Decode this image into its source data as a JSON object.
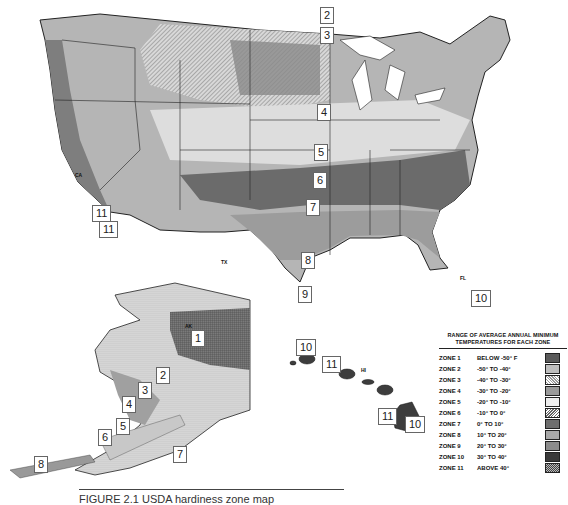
{
  "figure": {
    "caption": "FIGURE 2.1   USDA hardiness zone map",
    "caption_visible_fragment": "FIGURE 2.1  USDA hardi..."
  },
  "map": {
    "regions": [
      "Contiguous United States",
      "Alaska",
      "Hawaii"
    ],
    "zone_callouts": {
      "conus": [
        "2",
        "3",
        "4",
        "5",
        "6",
        "7",
        "8",
        "9",
        "10",
        "11",
        "11"
      ],
      "alaska": [
        "1",
        "2",
        "3",
        "4",
        "5",
        "6",
        "7",
        "8"
      ],
      "hawaii": [
        "10",
        "11",
        "11",
        "10"
      ]
    },
    "state_labels": [
      "WA",
      "OR",
      "CA",
      "NV",
      "ID",
      "MT",
      "WY",
      "UT",
      "AZ",
      "CO",
      "NM",
      "ND",
      "SD",
      "NE",
      "KS",
      "OK",
      "TX",
      "MN",
      "IA",
      "MO",
      "AR",
      "LA",
      "WI",
      "IL",
      "MI",
      "IN",
      "OH",
      "KY",
      "TN",
      "MS",
      "AL",
      "GA",
      "FL",
      "SC",
      "NC",
      "VA",
      "WV",
      "PA",
      "NY",
      "VT",
      "NH",
      "ME",
      "MA",
      "RI",
      "CT",
      "NJ",
      "DE",
      "MD",
      "AK",
      "HI"
    ]
  },
  "legend": {
    "title_line1": "RANGE OF AVERAGE ANNUAL MINIMUM",
    "title_line2": "TEMPERATURES FOR EACH ZONE",
    "rows": [
      {
        "zone": "ZONE 1",
        "range": "BELOW -50° F",
        "fill": "#5a5a5a",
        "pattern": "grid"
      },
      {
        "zone": "ZONE 2",
        "range": "-50°  TO -40°",
        "fill": "#bdbdbd",
        "pattern": "dots"
      },
      {
        "zone": "ZONE 3",
        "range": "-40°  TO -30°",
        "fill": "#e2e2e2",
        "pattern": "diag-light"
      },
      {
        "zone": "ZONE 4",
        "range": "-30°  TO -20°",
        "fill": "#9a9a9a",
        "pattern": "diag-dense"
      },
      {
        "zone": "ZONE 5",
        "range": "-20°  TO -10°",
        "fill": "#ededed",
        "pattern": "horizontal"
      },
      {
        "zone": "ZONE 6",
        "range": "-10°  TO  0°",
        "fill": "#cfcfcf",
        "pattern": "diag"
      },
      {
        "zone": "ZONE 7",
        "range": "0°  TO  10°",
        "fill": "#6e6e6e",
        "pattern": "solid-dark"
      },
      {
        "zone": "ZONE 8",
        "range": "10°  TO  20°",
        "fill": "#a8a8a8",
        "pattern": "fine"
      },
      {
        "zone": "ZONE 9",
        "range": "20°  TO  30°",
        "fill": "#8c8c8c",
        "pattern": "stipple"
      },
      {
        "zone": "ZONE 10",
        "range": "30°  TO  40°",
        "fill": "#3a3a3a",
        "pattern": "dark"
      },
      {
        "zone": "ZONE 11",
        "range": "ABOVE 40°",
        "fill": "#7a7a7a",
        "pattern": "checker"
      }
    ]
  }
}
